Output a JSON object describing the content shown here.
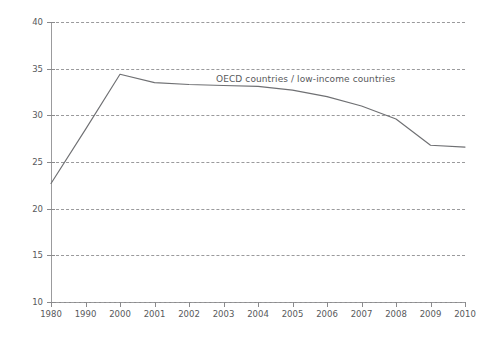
{
  "chart_data": {
    "type": "line",
    "title": "",
    "subtitle": "",
    "xlabel": "",
    "ylabel": "Ratio",
    "categories": [
      "1980",
      "1990",
      "2000",
      "2001",
      "2002",
      "2003",
      "2004",
      "2005",
      "2006",
      "2007",
      "2008",
      "2009",
      "2010"
    ],
    "series": [
      {
        "name": "OECD countries / low-income countries",
        "values": [
          22.7,
          28.5,
          34.4,
          33.5,
          33.3,
          33.2,
          33.1,
          32.7,
          32.0,
          31.0,
          29.6,
          26.8,
          26.6
        ]
      }
    ],
    "ylim": [
      10,
      40
    ],
    "yticks": [
      10,
      15,
      20,
      25,
      30,
      35,
      40
    ],
    "ytick_labels": [
      "10",
      "15",
      "20",
      "25",
      "30",
      "35",
      "40"
    ],
    "grid": "horizontal-dashed",
    "legend": "inline-annotation",
    "annotations": [
      {
        "text": "OECD countries / low-income countries",
        "x_category": "2003",
        "y_value": 33.8
      }
    ],
    "colors": {
      "line": "#6f7073",
      "grid": "#9a9a9c",
      "axis": "#8a8a8c",
      "text": "#58595b",
      "background": "#ffffff"
    }
  }
}
